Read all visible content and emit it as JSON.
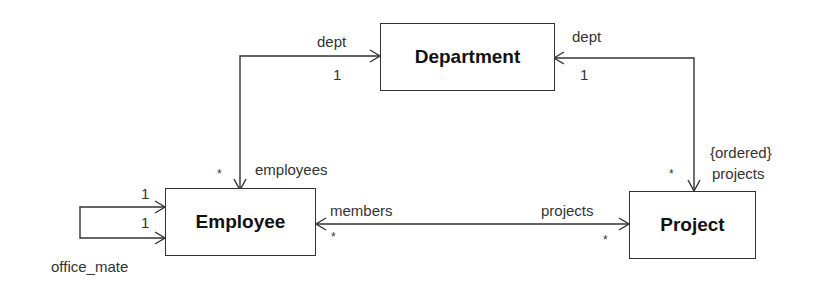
{
  "diagram": {
    "type": "UML class diagram",
    "classes": {
      "department": "Department",
      "employee": "Employee",
      "project": "Project"
    },
    "associations": [
      {
        "from": "Employee",
        "to": "Department",
        "role_near_department": "dept",
        "mult_near_department": "1",
        "role_near_employee": "employees",
        "mult_near_employee": "*"
      },
      {
        "from": "Project",
        "to": "Department",
        "role_near_department": "dept",
        "mult_near_department": "1",
        "role_near_project": "{ordered} projects",
        "mult_near_project": "*"
      },
      {
        "from": "Employee",
        "to": "Project",
        "role_near_employee": "members",
        "mult_near_employee": "*",
        "role_near_project": "projects",
        "mult_near_project": "*"
      },
      {
        "from": "Employee",
        "to": "Employee",
        "role": "office_mate",
        "mult_a": "1",
        "mult_b": "1"
      }
    ],
    "labels": {
      "dept_left": "dept",
      "one_left": "1",
      "dept_right": "dept",
      "one_right": "1",
      "employees": "employees",
      "star_employees": "*",
      "ordered": "{ordered}",
      "projects_top": "projects",
      "star_projects_top": "*",
      "members": "members",
      "star_members": "*",
      "projects_bottom": "projects",
      "star_projects_bottom": "*",
      "self_one_top": "1",
      "self_one_bottom": "1",
      "office_mate": "office_mate"
    }
  }
}
